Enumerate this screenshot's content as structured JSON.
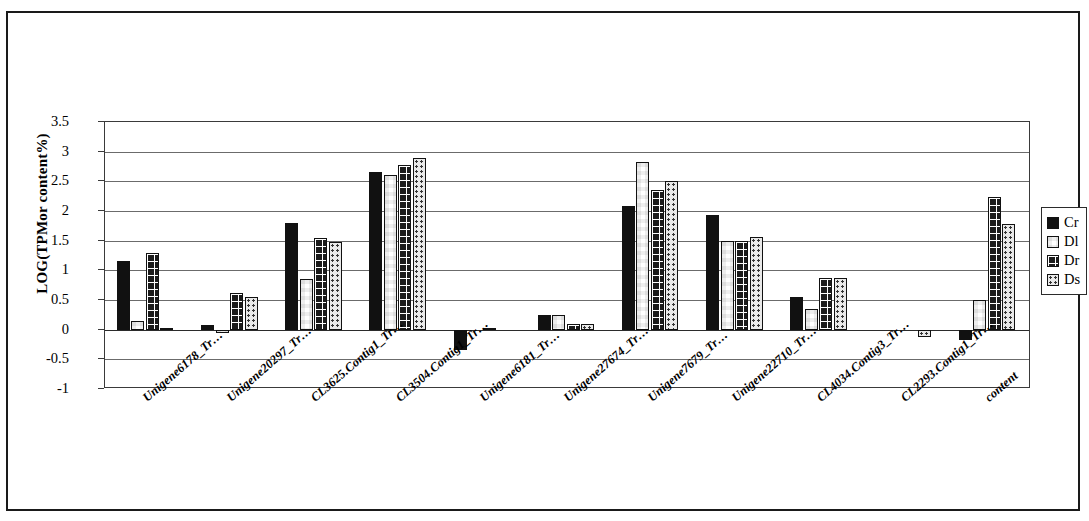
{
  "chart_data": {
    "type": "bar",
    "title": "",
    "xlabel": "",
    "ylabel": "LOG(TPMor content%)",
    "ylim": [
      -1,
      3.5
    ],
    "ytick_step": 0.5,
    "yticks": [
      "3.5",
      "3",
      "2.5",
      "2",
      "1.5",
      "1",
      "0.5",
      "0",
      "-0.5",
      "-1"
    ],
    "grid": true,
    "legend_position": "right",
    "categories": [
      "Unigene6178_Tr…",
      "Unigene20297_Tr…",
      "CL3625.Contig1_Tr…",
      "CL3504.Contig1_Tr…",
      "Unigene6181_Tr…",
      "Unigene27674_Tr…",
      "Unigene7679_Tr…",
      "Unigene22710_Tr…",
      "CL4034.Contig3_Tr…",
      "CL2293.Contig1_Tr…",
      "content"
    ],
    "series": [
      {
        "name": "Cr",
        "fill": "solid-black",
        "color": "#111111",
        "values": [
          1.15,
          0.08,
          1.8,
          2.65,
          -0.35,
          0.25,
          2.08,
          1.93,
          0.55,
          0.0,
          -0.17
        ]
      },
      {
        "name": "Dl",
        "fill": "checkerboard",
        "color": "#111111",
        "values": [
          0.15,
          -0.05,
          0.85,
          2.6,
          0.0,
          0.25,
          2.82,
          1.5,
          0.35,
          0.0,
          0.5
        ]
      },
      {
        "name": "Dr",
        "fill": "dark-grid",
        "color": "#1b1b1b",
        "values": [
          1.3,
          0.62,
          1.55,
          2.78,
          0.02,
          0.1,
          2.35,
          1.5,
          0.87,
          0.0,
          2.23
        ]
      },
      {
        "name": "Ds",
        "fill": "light-dotted",
        "color": "#e9e9e9",
        "values": [
          0.03,
          0.55,
          1.48,
          2.9,
          0.0,
          0.1,
          2.5,
          1.57,
          0.87,
          -0.12,
          1.78
        ]
      }
    ]
  },
  "legend": {
    "items": [
      {
        "label": "Cr"
      },
      {
        "label": "Dl"
      },
      {
        "label": "Dr"
      },
      {
        "label": "Ds"
      }
    ]
  }
}
